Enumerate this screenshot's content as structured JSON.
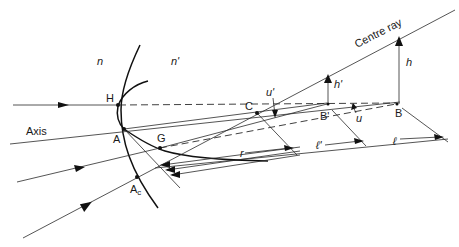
{
  "diagram": {
    "media": {
      "object_index": "n",
      "image_index": "n'"
    },
    "points": {
      "H": "H",
      "A": "A",
      "G": "G",
      "Ac": "A",
      "Ac_sub": "c",
      "C": "C",
      "B_prime": "B'",
      "B": "B"
    },
    "lines": {
      "axis": "Axis",
      "centre_ray": "Centre ray"
    },
    "quantities": {
      "h": "h",
      "h_prime": "h'",
      "u": "u",
      "u_prime": "u'",
      "r": "r",
      "l_prime": "ℓ'",
      "l": "ℓ"
    },
    "colors": {
      "ink": "#1a1a1a",
      "background": "#ffffff"
    }
  }
}
